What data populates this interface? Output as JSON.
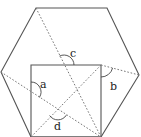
{
  "diagram": {
    "colors": {
      "solid_line": "#555555",
      "dotted_line": "#777777",
      "label": "#222222",
      "background": "#ffffff"
    },
    "hexagon": {
      "vertices": [
        [
          36,
          8
        ],
        [
          107,
          8
        ],
        [
          139,
          75
        ],
        [
          101,
          137
        ],
        [
          31,
          137
        ],
        [
          1,
          72
        ]
      ]
    },
    "square": {
      "vertices": [
        [
          31,
          65
        ],
        [
          101,
          65
        ],
        [
          101,
          137
        ],
        [
          31,
          137
        ]
      ]
    },
    "dotted_lines": [
      {
        "name": "hex-topleft-to-square-bottomright",
        "from": [
          36,
          8
        ],
        "to": [
          101,
          137
        ]
      },
      {
        "name": "square-diagonal",
        "from": [
          101,
          65
        ],
        "to": [
          31,
          137
        ]
      },
      {
        "name": "hex-left-to-square-bottomright",
        "from": [
          1,
          72
        ],
        "to": [
          101,
          137
        ]
      },
      {
        "name": "square-topright-to-hex-right",
        "from": [
          101,
          65
        ],
        "to": [
          139,
          75
        ]
      }
    ],
    "angles": [
      {
        "label": "a",
        "vertex": [
          31,
          92
        ],
        "label_pos": [
          44,
          88
        ]
      },
      {
        "label": "b",
        "vertex": [
          101,
          65
        ],
        "label_pos": [
          113,
          89
        ]
      },
      {
        "label": "c",
        "vertex": [
          64,
          65
        ],
        "label_pos": [
          73,
          56
        ]
      },
      {
        "label": "d",
        "vertex": [
          58,
          109
        ],
        "label_pos": [
          55,
          131
        ]
      }
    ]
  }
}
